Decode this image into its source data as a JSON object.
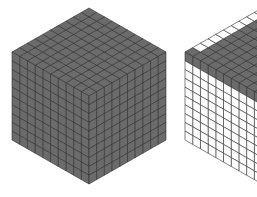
{
  "diagram": {
    "type": "isometric-unit-cubes",
    "grid_size": 10,
    "colors": {
      "filled": "#6b6b6b",
      "empty": "#ffffff",
      "line": "#2f2f2f",
      "background": "#ffffff"
    },
    "cubes": [
      {
        "name": "full-cube",
        "origin": [
          89,
          96
        ],
        "edge_px_x": 77,
        "edge_px_y": 44,
        "edge_px_z": 88,
        "top_face": "filled",
        "left_face": "filled",
        "right_face": "filled"
      },
      {
        "name": "partial-cube",
        "origin": [
          262,
          96
        ],
        "edge_px_x": 77,
        "edge_px_y": 44,
        "edge_px_z": 88,
        "top_face": "filled-with-white-back-row",
        "left_face": "top-row-filled-rest-empty",
        "right_face": "filled"
      }
    ]
  }
}
